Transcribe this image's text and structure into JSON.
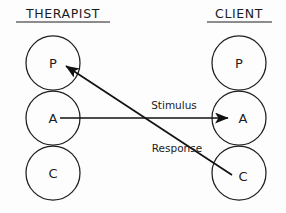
{
  "diagram": {
    "type": "transactional-analysis-ego-state-diagram",
    "background_color": "#fdfdfd",
    "ink_color": "#1c1c1c",
    "columns": [
      {
        "key": "therapist",
        "heading": "THERAPIST",
        "heading_underlined": true,
        "heading_x": 63,
        "heading_y": 18,
        "heading_rule_x1": 16,
        "heading_rule_x2": 110,
        "heading_rule_y": 22,
        "circle_cx": 53,
        "states": [
          {
            "label": "P",
            "name": "parent",
            "cy": 63,
            "r": 27
          },
          {
            "label": "A",
            "name": "adult",
            "cy": 118,
            "r": 27
          },
          {
            "label": "C",
            "name": "child",
            "cy": 173,
            "r": 27
          }
        ]
      },
      {
        "key": "client",
        "heading": "CLIENT",
        "heading_underlined": true,
        "heading_x": 239,
        "heading_y": 18,
        "heading_rule_x1": 207,
        "heading_rule_x2": 272,
        "heading_rule_y": 22,
        "circle_cx": 239,
        "states": [
          {
            "label": "P",
            "name": "parent",
            "cy": 63,
            "r": 27
          },
          {
            "label": "A",
            "name": "adult",
            "cy": 118,
            "r": 27
          },
          {
            "label": "C",
            "name": "child",
            "cy": 173,
            "r": 27
          }
        ]
      }
    ],
    "transactions": [
      {
        "key": "stimulus",
        "label": "Stimulus",
        "from": "therapist-adult",
        "to": "client-adult",
        "x1": 60,
        "y1": 118,
        "x2": 228,
        "y2": 118,
        "label_x": 174,
        "label_y": 109,
        "arrowhead_at": "end"
      },
      {
        "key": "response",
        "label": "Response",
        "from": "client-child",
        "to": "therapist-parent",
        "x1": 232,
        "y1": 175,
        "x2": 66,
        "y2": 66,
        "label_x": 177,
        "label_y": 152,
        "arrowhead_at": "end"
      }
    ]
  }
}
